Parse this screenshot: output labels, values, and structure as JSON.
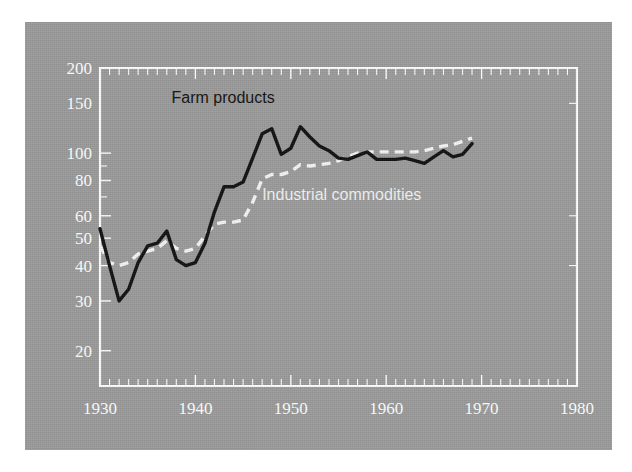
{
  "figure": {
    "background_color": "#ffffff",
    "panel_color": "#9b9b9b"
  },
  "labels": {
    "farm_products": "Farm products",
    "industrial_commodities": "Industrial commodities"
  },
  "axis": {
    "y_ticks": [
      "200",
      "150",
      "100",
      "80",
      "60",
      "50",
      "40",
      "30",
      "20"
    ],
    "x_ticks": [
      "1930",
      "1940",
      "1950",
      "1960",
      "1970",
      "1980"
    ]
  },
  "chart_data": {
    "type": "line",
    "title": "",
    "subtitle": "",
    "xlabel": "",
    "ylabel": "",
    "xlim": [
      1930,
      1980
    ],
    "ylim": [
      15,
      200
    ],
    "yscale": "log",
    "grid": false,
    "legend": "inline-annotations",
    "x_tick_labels": [
      1930,
      1940,
      1950,
      1960,
      1970,
      1980
    ],
    "y_tick_labels": [
      200,
      150,
      100,
      80,
      60,
      50,
      40,
      30,
      20
    ],
    "x_minor_tick_interval": 1,
    "annotations": [
      {
        "text": "Farm products",
        "x": 1937.5,
        "y": 150,
        "color": "#111111"
      },
      {
        "text": "Industrial commodities",
        "x": 1947.0,
        "y": 68,
        "color": "#f2f2f2"
      }
    ],
    "series": [
      {
        "name": "Farm products",
        "color": "#111111",
        "style": "solid",
        "x": [
          1930,
          1931,
          1932,
          1933,
          1934,
          1935,
          1936,
          1937,
          1938,
          1939,
          1940,
          1941,
          1942,
          1943,
          1944,
          1945,
          1946,
          1947,
          1948,
          1949,
          1950,
          1951,
          1952,
          1953,
          1954,
          1955,
          1956,
          1957,
          1958,
          1959,
          1960,
          1961,
          1962,
          1963,
          1964,
          1965,
          1966,
          1967,
          1968,
          1969
        ],
        "values": [
          54,
          40,
          30,
          33,
          41,
          47,
          48,
          53,
          42,
          40,
          41,
          48,
          62,
          76,
          76,
          79,
          96,
          117,
          122,
          99,
          104,
          124,
          114,
          106,
          102,
          96,
          95,
          98,
          101,
          95,
          95,
          95,
          96,
          94,
          92,
          97,
          102,
          97,
          99,
          108
        ]
      },
      {
        "name": "Industrial commodities",
        "color": "#f5f5f5",
        "style": "dashed",
        "x": [
          1930,
          1931,
          1932,
          1933,
          1934,
          1935,
          1936,
          1937,
          1938,
          1939,
          1940,
          1941,
          1942,
          1943,
          1944,
          1945,
          1946,
          1947,
          1948,
          1949,
          1950,
          1951,
          1952,
          1953,
          1954,
          1955,
          1956,
          1957,
          1958,
          1959,
          1960,
          1961,
          1962,
          1963,
          1964,
          1965,
          1966,
          1967,
          1968,
          1969
        ],
        "values": [
          47,
          41,
          40,
          41,
          44,
          45,
          46,
          49,
          46,
          45,
          46,
          51,
          56,
          57,
          57,
          58,
          67,
          81,
          84,
          84,
          86,
          91,
          90,
          91,
          92,
          94,
          97,
          100,
          101,
          101,
          101,
          101,
          101,
          101,
          102,
          104,
          106,
          107,
          110,
          113
        ]
      }
    ]
  }
}
